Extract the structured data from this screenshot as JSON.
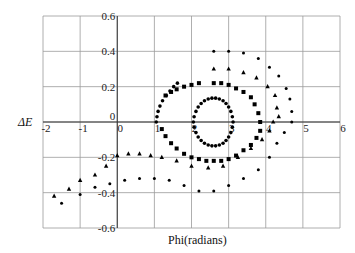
{
  "chart_data": {
    "type": "scatter",
    "title": "",
    "xlabel": "Phi(radians)",
    "ylabel": "ΔE",
    "xlim": [
      -2,
      6
    ],
    "ylim": [
      -0.6,
      0.6
    ],
    "xticks": [
      -2,
      -1,
      0,
      1,
      2,
      3,
      4,
      5,
      6
    ],
    "yticks": [
      0.6,
      0.4,
      0.2,
      0,
      -0.2,
      -0.4,
      -0.6
    ],
    "xtick_labels": [
      "-2",
      "-1",
      "0",
      "1",
      "2",
      "3",
      "4",
      "5",
      "6"
    ],
    "ytick_labels": [
      "0.6",
      "0.4",
      "0.2",
      "0",
      "-0.2",
      "-0.4",
      "-0.6"
    ],
    "grid": true,
    "legend": null,
    "series": [
      {
        "name": "inner closed orbit",
        "marker": "circle-small",
        "points": [
          [
            2.05,
            0.0
          ],
          [
            2.07,
            0.03
          ],
          [
            2.12,
            0.06
          ],
          [
            2.18,
            0.085
          ],
          [
            2.26,
            0.105
          ],
          [
            2.35,
            0.12
          ],
          [
            2.45,
            0.13
          ],
          [
            2.55,
            0.135
          ],
          [
            2.65,
            0.135
          ],
          [
            2.75,
            0.13
          ],
          [
            2.85,
            0.12
          ],
          [
            2.93,
            0.105
          ],
          [
            3.0,
            0.085
          ],
          [
            3.06,
            0.06
          ],
          [
            3.1,
            0.03
          ],
          [
            3.12,
            0.0
          ],
          [
            3.1,
            -0.03
          ],
          [
            3.06,
            -0.06
          ],
          [
            3.0,
            -0.085
          ],
          [
            2.93,
            -0.105
          ],
          [
            2.85,
            -0.12
          ],
          [
            2.75,
            -0.13
          ],
          [
            2.65,
            -0.135
          ],
          [
            2.55,
            -0.135
          ],
          [
            2.45,
            -0.13
          ],
          [
            2.35,
            -0.12
          ],
          [
            2.26,
            -0.105
          ],
          [
            2.18,
            -0.085
          ],
          [
            2.12,
            -0.06
          ],
          [
            2.07,
            -0.03
          ]
        ]
      },
      {
        "name": "near-separatrix orbit",
        "marker": "circle-small",
        "points": [
          [
            1.05,
            0.0
          ],
          [
            1.07,
            0.03
          ],
          [
            1.1,
            0.06
          ],
          [
            1.15,
            0.09
          ],
          [
            1.22,
            0.12
          ],
          [
            1.32,
            0.15
          ],
          [
            1.42,
            0.175
          ],
          [
            1.52,
            0.2
          ],
          [
            1.62,
            0.22
          ]
        ]
      },
      {
        "name": "square orbit",
        "marker": "square",
        "points": [
          [
            1.3,
            0.15
          ],
          [
            1.45,
            0.17
          ],
          [
            1.6,
            0.185
          ],
          [
            1.8,
            0.2
          ],
          [
            2.0,
            0.21
          ],
          [
            2.2,
            0.22
          ],
          [
            2.6,
            0.22
          ],
          [
            2.8,
            0.22
          ],
          [
            3.0,
            0.21
          ],
          [
            3.2,
            0.19
          ],
          [
            3.4,
            0.17
          ],
          [
            3.6,
            0.14
          ],
          [
            3.7,
            0.1
          ],
          [
            3.8,
            0.05
          ],
          [
            3.85,
            0.0
          ],
          [
            3.85,
            -0.05
          ],
          [
            3.75,
            -0.09
          ],
          [
            3.6,
            -0.13
          ],
          [
            3.4,
            -0.16
          ],
          [
            3.2,
            -0.19
          ],
          [
            3.0,
            -0.21
          ],
          [
            2.8,
            -0.22
          ],
          [
            2.6,
            -0.22
          ],
          [
            2.4,
            -0.22
          ],
          [
            2.2,
            -0.21
          ],
          [
            2.0,
            -0.2
          ],
          [
            1.8,
            -0.18
          ],
          [
            1.6,
            -0.15
          ],
          [
            1.45,
            -0.12
          ],
          [
            1.3,
            -0.08
          ],
          [
            1.2,
            -0.04
          ]
        ]
      },
      {
        "name": "triangle orbit",
        "marker": "triangle",
        "points": [
          [
            2.6,
            0.3
          ],
          [
            3.0,
            0.3
          ],
          [
            3.4,
            0.28
          ],
          [
            3.75,
            0.25
          ],
          [
            4.05,
            0.2
          ],
          [
            4.25,
            0.15
          ],
          [
            4.3,
            0.08
          ],
          [
            4.35,
            0.03
          ],
          [
            4.2,
            0.0
          ],
          [
            4.1,
            -0.05
          ],
          [
            3.9,
            -0.1
          ],
          [
            3.6,
            -0.15
          ],
          [
            3.25,
            -0.2
          ],
          [
            2.85,
            -0.25
          ],
          [
            2.45,
            -0.26
          ],
          [
            2.0,
            -0.25
          ],
          [
            1.6,
            -0.22
          ],
          [
            1.2,
            -0.2
          ],
          [
            0.9,
            -0.19
          ],
          [
            0.6,
            -0.18
          ],
          [
            0.3,
            -0.18
          ],
          [
            0.0,
            -0.19
          ],
          [
            -0.3,
            -0.25
          ],
          [
            -0.6,
            -0.3
          ],
          [
            -1.0,
            -0.33
          ],
          [
            -1.3,
            -0.38
          ],
          [
            -1.7,
            -0.42
          ]
        ]
      },
      {
        "name": "outer circle orbit",
        "marker": "circle",
        "points": [
          [
            2.6,
            0.4
          ],
          [
            3.0,
            0.4
          ],
          [
            3.4,
            0.39
          ],
          [
            3.8,
            0.36
          ],
          [
            4.1,
            0.31
          ],
          [
            4.35,
            0.26
          ],
          [
            4.55,
            0.19
          ],
          [
            4.65,
            0.13
          ],
          [
            4.7,
            0.06
          ],
          [
            4.7,
            0.0
          ],
          [
            4.5,
            -0.06
          ],
          [
            4.3,
            -0.12
          ],
          [
            4.1,
            -0.2
          ],
          [
            3.8,
            -0.27
          ],
          [
            3.4,
            -0.32
          ],
          [
            3.0,
            -0.36
          ],
          [
            2.6,
            -0.39
          ],
          [
            2.2,
            -0.39
          ],
          [
            1.8,
            -0.36
          ],
          [
            1.4,
            -0.33
          ],
          [
            1.0,
            -0.32
          ],
          [
            0.6,
            -0.32
          ],
          [
            0.2,
            -0.33
          ],
          [
            -0.2,
            -0.35
          ],
          [
            -0.6,
            -0.37
          ],
          [
            -1.0,
            -0.41
          ],
          [
            -1.5,
            -0.46
          ]
        ]
      }
    ]
  }
}
